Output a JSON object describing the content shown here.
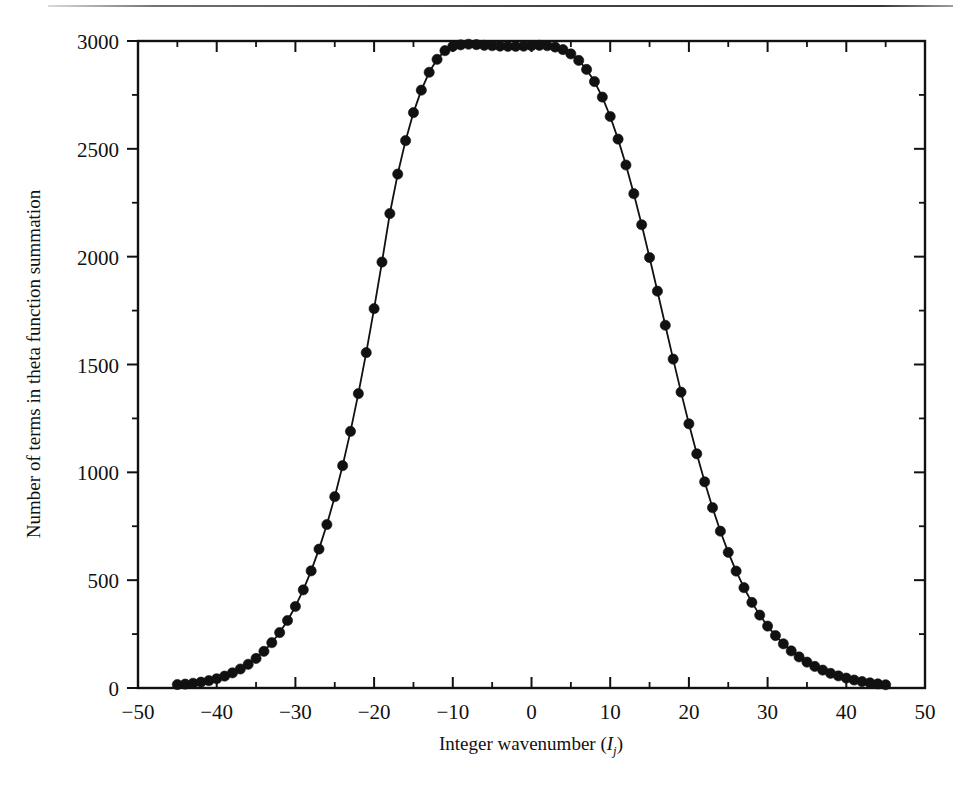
{
  "figure": {
    "page_rule_name": "page-top-rule"
  },
  "chart_data": {
    "type": "line",
    "title": "",
    "subtitle": "",
    "xlabel": "Integer wavenumber (Ij)",
    "xlabel_main": "Integer wavenumber (",
    "xlabel_symbol": "I",
    "xlabel_sub": "j",
    "xlabel_close": ")",
    "ylabel": "Number of terms in theta function summation",
    "xlim": [
      -50,
      50
    ],
    "ylim": [
      0,
      3000
    ],
    "x_major_ticks": [
      -50,
      -40,
      -30,
      -20,
      -10,
      0,
      10,
      20,
      30,
      40,
      50
    ],
    "x_major_tick_labels": [
      "-50",
      "-40",
      "-30",
      "-20",
      "-10",
      "0",
      "10",
      "20",
      "30",
      "40",
      "50"
    ],
    "x_minor_ticks": [
      -45,
      -35,
      -25,
      -15,
      -5,
      5,
      15,
      25,
      35,
      45
    ],
    "y_major_ticks": [
      0,
      500,
      1000,
      1500,
      2000,
      2500,
      3000
    ],
    "y_major_tick_labels": [
      "0",
      "500",
      "1000",
      "1500",
      "2000",
      "2500",
      "3000"
    ],
    "y_minor_ticks": [
      250,
      750,
      1250,
      1750,
      2250,
      2750
    ],
    "grid": false,
    "legend": null,
    "marker": "filled-circle",
    "marker_color": "#111111",
    "line_color": "#111111",
    "series": [
      {
        "name": "Number of terms in theta function summation",
        "x": [
          -45,
          -44,
          -43,
          -42,
          -41,
          -40,
          -39,
          -38,
          -37,
          -36,
          -35,
          -34,
          -33,
          -32,
          -31,
          -30,
          -29,
          -28,
          -27,
          -26,
          -25,
          -24,
          -23,
          -22,
          -21,
          -20,
          -19,
          -18,
          -17,
          -16,
          -15,
          -14,
          -13,
          -12,
          -11,
          -10,
          -9,
          -8,
          -7,
          -6,
          -5,
          -4,
          -3,
          -2,
          -1,
          0,
          1,
          2,
          3,
          4,
          5,
          6,
          7,
          8,
          9,
          10,
          11,
          12,
          13,
          14,
          15,
          16,
          17,
          18,
          19,
          20,
          21,
          22,
          23,
          24,
          25,
          26,
          27,
          28,
          29,
          30,
          31,
          32,
          33,
          34,
          35,
          36,
          37,
          38,
          39,
          40,
          41,
          42,
          43,
          44,
          45
        ],
        "y": [
          16,
          18,
          22,
          27,
          34,
          43,
          55,
          70,
          88,
          110,
          137,
          170,
          210,
          257,
          313,
          378,
          455,
          543,
          644,
          758,
          887,
          1031,
          1190,
          1365,
          1555,
          1759,
          1975,
          2200,
          2383,
          2538,
          2668,
          2772,
          2855,
          2915,
          2955,
          2975,
          2982,
          2985,
          2983,
          2980,
          2978,
          2976,
          2975,
          2975,
          2976,
          2978,
          2980,
          2978,
          2972,
          2960,
          2940,
          2910,
          2868,
          2812,
          2740,
          2650,
          2545,
          2425,
          2292,
          2148,
          1996,
          1840,
          1682,
          1525,
          1372,
          1225,
          1086,
          956,
          836,
          727,
          629,
          542,
          465,
          397,
          338,
          287,
          243,
          205,
          172,
          144,
          120,
          100,
          83,
          68,
          56,
          46,
          37,
          30,
          24,
          19,
          15
        ]
      }
    ]
  }
}
